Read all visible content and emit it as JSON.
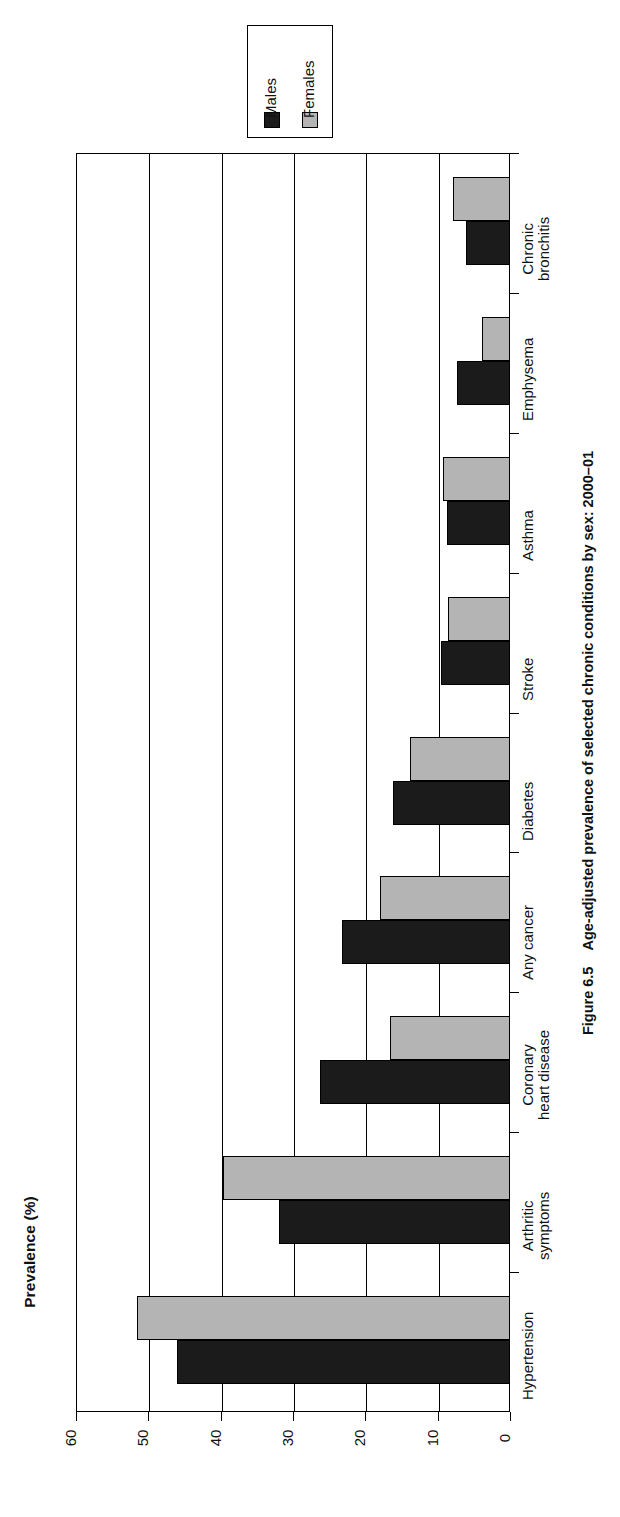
{
  "figure": {
    "number": "Figure 6.5",
    "caption": "Age-adjusted prevalence of selected chronic conditions by sex: 2000–01"
  },
  "axis": {
    "title": "Prevalence (%)",
    "ticks": [
      "60",
      "50",
      "40",
      "30",
      "20",
      "10",
      "0"
    ]
  },
  "legend": {
    "items": [
      {
        "label": "Males",
        "color": "#1b1b1b"
      },
      {
        "label": "Females",
        "color": "#b4b4b4"
      }
    ]
  },
  "chart_data": {
    "type": "bar",
    "orientation": "horizontal",
    "title": "Age-adjusted prevalence of selected chronic conditions by sex: 2000–01",
    "xlabel": "Prevalence (%)",
    "ylabel": "",
    "xlim": [
      0,
      60
    ],
    "xticks": [
      0,
      10,
      20,
      30,
      40,
      50,
      60
    ],
    "grid": true,
    "legend_position": "top-right",
    "categories": [
      "Hypertension",
      "Arthritic symptoms",
      "Coronary heart disease",
      "Any cancer",
      "Diabetes",
      "Stroke",
      "Asthma",
      "Emphysema",
      "Chronic bronchitis"
    ],
    "category_lines": [
      [
        "Hypertension",
        ""
      ],
      [
        "Arthritic",
        "symptoms"
      ],
      [
        "Coronary",
        "heart disease"
      ],
      [
        "Any cancer",
        ""
      ],
      [
        "Diabetes",
        ""
      ],
      [
        "Stroke",
        ""
      ],
      [
        "Asthma",
        ""
      ],
      [
        "Emphysema",
        ""
      ],
      [
        "Chronic",
        "bronchitis"
      ]
    ],
    "series": [
      {
        "name": "Males",
        "color": "#1b1b1b",
        "values": [
          46.0,
          32.0,
          26.3,
          23.2,
          16.2,
          9.6,
          8.7,
          7.3,
          6.1
        ]
      },
      {
        "name": "Females",
        "color": "#b4b4b4",
        "values": [
          51.5,
          39.7,
          16.6,
          18.0,
          13.8,
          8.6,
          9.3,
          3.9,
          7.9
        ]
      }
    ]
  }
}
